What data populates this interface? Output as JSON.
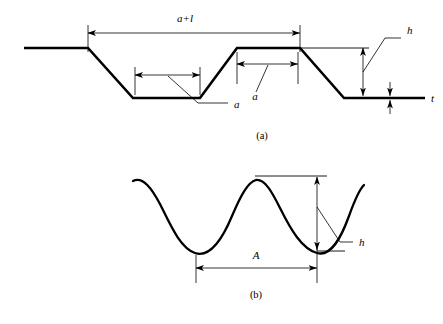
{
  "figure": {
    "width": 443,
    "height": 324,
    "background_color": "#ffffff",
    "line_color": "#000000"
  },
  "panels": [
    {
      "id": "panel-a",
      "caption": "(a)",
      "caption_pos": {
        "x": 262,
        "y": 139
      },
      "description": "Idealized trapezoidal surface profile",
      "profile": {
        "type": "polyline-trapezoidal",
        "stroke_width": 2.6,
        "points": [
          {
            "x": 24,
            "y": 48
          },
          {
            "x": 88,
            "y": 48
          },
          {
            "x": 133,
            "y": 98
          },
          {
            "x": 200,
            "y": 98
          },
          {
            "x": 237,
            "y": 48
          },
          {
            "x": 300,
            "y": 48
          },
          {
            "x": 344,
            "y": 98
          },
          {
            "x": 425,
            "y": 98
          }
        ]
      },
      "reference_lines": [
        {
          "name": "h-top-reference",
          "x1": 300,
          "y1": 48,
          "x2": 369,
          "y2": 48
        }
      ],
      "dimensions": [
        {
          "name": "a-plus-l",
          "label": "a+l",
          "label_pos": {
            "x": 185,
            "y": 22
          },
          "orientation": "horizontal",
          "line": {
            "x1": 88,
            "y1": 33,
            "x2": 300,
            "y2": 33
          },
          "extensions": [
            {
              "x1": 88,
              "y1": 25,
              "x2": 88,
              "y2": 52
            },
            {
              "x1": 300,
              "y1": 25,
              "x2": 300,
              "y2": 52
            }
          ]
        },
        {
          "name": "a-trough-width",
          "label": "a",
          "label_pos": {
            "x": 234,
            "y": 108
          },
          "orientation": "horizontal",
          "line": {
            "x1": 135,
            "y1": 75,
            "x2": 200,
            "y2": 75
          },
          "extensions": [
            {
              "x1": 135,
              "y1": 67,
              "x2": 135,
              "y2": 95
            },
            {
              "x1": 200,
              "y1": 67,
              "x2": 200,
              "y2": 95
            }
          ],
          "leader": [
            {
              "x": 168,
              "y": 76
            },
            {
              "x": 198,
              "y": 103
            },
            {
              "x": 228,
              "y": 103
            }
          ]
        },
        {
          "name": "a-plateau-width",
          "label": "a",
          "label_pos": {
            "x": 255,
            "y": 100
          },
          "orientation": "horizontal",
          "line": {
            "x1": 237,
            "y1": 64,
            "x2": 298,
            "y2": 64
          },
          "extensions": [
            {
              "x1": 237,
              "y1": 52,
              "x2": 237,
              "y2": 84
            },
            {
              "x1": 298,
              "y1": 52,
              "x2": 298,
              "y2": 84
            }
          ],
          "leader": [
            {
              "x": 268,
              "y": 65
            },
            {
              "x": 256,
              "y": 92
            }
          ]
        },
        {
          "name": "h-depth",
          "label": "h",
          "label_pos": {
            "x": 407,
            "y": 34
          },
          "orientation": "vertical",
          "line": {
            "x1": 363,
            "y1": 48,
            "x2": 363,
            "y2": 96
          },
          "extensions": [],
          "leader": [
            {
              "x": 363,
              "y": 72
            },
            {
              "x": 385,
              "y": 38
            },
            {
              "x": 401,
              "y": 38
            }
          ]
        },
        {
          "name": "t-thickness",
          "label": "t",
          "label_pos": {
            "x": 431,
            "y": 102
          },
          "orientation": "vertical-outward",
          "line": {
            "x1": 390,
            "y1": 82,
            "x2": 390,
            "y2": 114
          },
          "gap": {
            "y1": 96,
            "y2": 100
          }
        }
      ]
    },
    {
      "id": "panel-b",
      "caption": "(b)",
      "caption_pos": {
        "x": 256,
        "y": 298
      },
      "description": "Real sinusoidal surface waviness profile",
      "profile": {
        "type": "sinusoid",
        "stroke_width": 2.3,
        "path": "M 133 181 C 143 176 152 189 160 204 C 170 224 180 248 195 253 C 210 258 222 240 232 216 C 241 195 248 182 256 180 C 265 179 272 192 280 208 C 291 230 302 249 317 253 C 331 257 341 238 349 216 C 354 202 359 190 364 185"
      },
      "reference_lines": [
        {
          "name": "h-top-reference",
          "x1": 255,
          "y1": 176,
          "x2": 327,
          "y2": 176
        },
        {
          "name": "h-bottom-reference",
          "x1": 317,
          "y1": 251,
          "x2": 345,
          "y2": 251
        }
      ],
      "dimensions": [
        {
          "name": "A-wavelength",
          "label": "A",
          "label_pos": {
            "x": 256,
            "y": 259
          },
          "orientation": "horizontal",
          "line": {
            "x1": 196,
            "y1": 268,
            "x2": 317,
            "y2": 268
          },
          "extensions": [
            {
              "x1": 196,
              "y1": 255,
              "x2": 196,
              "y2": 283
            },
            {
              "x1": 317,
              "y1": 243,
              "x2": 317,
              "y2": 283
            }
          ]
        },
        {
          "name": "h-amplitude",
          "label": "h",
          "label_pos": {
            "x": 359,
            "y": 246
          },
          "orientation": "vertical",
          "line": {
            "x1": 317,
            "y1": 177,
            "x2": 317,
            "y2": 250
          },
          "extensions": [],
          "leader": [
            {
              "x": 317,
              "y": 207
            },
            {
              "x": 340,
              "y": 242
            },
            {
              "x": 353,
              "y": 242
            }
          ]
        }
      ]
    }
  ],
  "symbols": {
    "a_plus_l": "a+l",
    "a": "a",
    "h": "h",
    "t": "t",
    "A": "A"
  }
}
